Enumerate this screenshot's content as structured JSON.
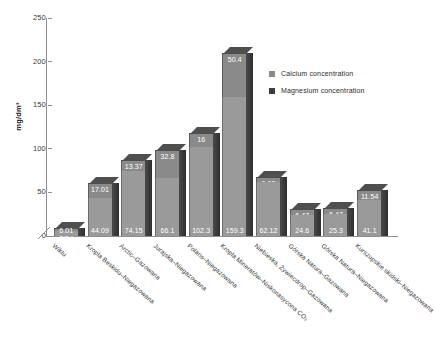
{
  "chart_data": {
    "type": "bar",
    "stacked": true,
    "title": "",
    "xlabel": "",
    "ylabel": "mg/dm³",
    "ylim": [
      0,
      250
    ],
    "yticks": [
      0,
      50,
      100,
      150,
      200,
      250
    ],
    "grid": false,
    "legend_position": "right",
    "categories": [
      "Wiklu",
      "Kropla Beskidu–Niegazowana",
      "Arctic–Gazowana",
      "Jurajska–Niegazowana",
      "Polaris–Niegazowana",
      "Kropla Mineratów–Niskonasycona CO₂",
      "Niebieska, Żywiecdrop–Gazowana",
      "Górska Natura–Gazowana",
      "Górska Natura–Niegazowana",
      "Kurszupskie skidski–Niegazowana"
    ],
    "series": [
      {
        "name": "Calcium concentration",
        "color": "#9a9a9a",
        "values": [
          6.01,
          44.09,
          74.15,
          66.1,
          102.3,
          159.3,
          62.12,
          24.6,
          25.3,
          41.1
        ],
        "labels": [
          "6.01",
          "44.09",
          "74.15",
          "66.1",
          "102.3",
          "159.3",
          "62.12",
          "24.6",
          "25.3",
          "41.1"
        ]
      },
      {
        "name": "Magnesium concentration",
        "color": "#4a4a4a",
        "values": [
          3.24,
          17.01,
          13.37,
          32.8,
          16,
          50.4,
          6.08,
          6.47,
          6.47,
          11.54
        ],
        "labels": [
          "3.24",
          "17.01",
          "13.37",
          "32.8",
          "16",
          "50.4",
          "6.08",
          "6.47",
          "6.47",
          "11.54"
        ]
      }
    ]
  },
  "legend": {
    "items": [
      {
        "label": "Calcium concentration",
        "color": "#8a8a8a"
      },
      {
        "label": "Magnesium concentration",
        "color": "#3d3d3d"
      }
    ]
  },
  "axis": {
    "y_title": "mg/dm³",
    "y_ticks": [
      "250",
      "200",
      "150",
      "100",
      "50",
      "0"
    ]
  }
}
